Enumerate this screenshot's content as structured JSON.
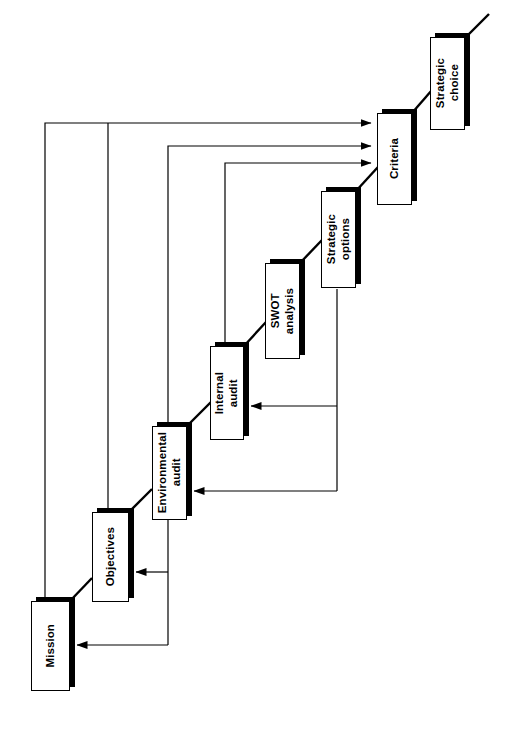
{
  "diagram": {
    "orientation": "rotated-90-ccw",
    "nodes": [
      {
        "id": "mission",
        "label": "Mission",
        "x": 31,
        "y": 601,
        "w": 39,
        "h": 90
      },
      {
        "id": "objectives",
        "label": "Objectives",
        "x": 92,
        "y": 512,
        "w": 37,
        "h": 90
      },
      {
        "id": "environmental-audit",
        "label": "Environmental\naudit",
        "x": 152,
        "y": 426,
        "w": 35,
        "h": 94
      },
      {
        "id": "internal-audit",
        "label": "Internal\naudit",
        "x": 210,
        "y": 346,
        "w": 34,
        "h": 94
      },
      {
        "id": "swot-analysis",
        "label": "SWOT\nanalysis",
        "x": 265,
        "y": 263,
        "w": 35,
        "h": 96
      },
      {
        "id": "strategic-options",
        "label": "Strategic\noptions",
        "x": 321,
        "y": 191,
        "w": 35,
        "h": 97
      },
      {
        "id": "criteria",
        "label": "Criteria",
        "x": 377,
        "y": 113,
        "w": 35,
        "h": 92
      },
      {
        "id": "strategic-choice",
        "label": "Strategic\nchoice",
        "x": 430,
        "y": 37,
        "w": 35,
        "h": 93
      }
    ],
    "colors": {
      "line": "#000000",
      "box_fill": "#ffffff",
      "box_border": "#000000",
      "shadow": "#000000",
      "background": "#ffffff"
    },
    "connections": [
      {
        "from": "mission",
        "to": "objectives",
        "type": "diagonal"
      },
      {
        "from": "objectives",
        "to": "environmental-audit",
        "type": "diagonal"
      },
      {
        "from": "environmental-audit",
        "to": "internal-audit",
        "type": "diagonal"
      },
      {
        "from": "internal-audit",
        "to": "swot-analysis",
        "type": "diagonal"
      },
      {
        "from": "swot-analysis",
        "to": "strategic-options",
        "type": "diagonal"
      },
      {
        "from": "strategic-options",
        "to": "criteria",
        "type": "diagonal"
      },
      {
        "from": "criteria",
        "to": "strategic-choice",
        "type": "diagonal"
      },
      {
        "from": "strategic-choice",
        "to": "output",
        "type": "diagonal-open"
      },
      {
        "from": "mission",
        "to": "criteria",
        "type": "feedback-orthogonal"
      },
      {
        "from": "objectives",
        "to": "criteria",
        "type": "feedback-orthogonal"
      },
      {
        "from": "environmental-audit",
        "to": "criteria",
        "type": "feedback-orthogonal"
      },
      {
        "from": "internal-audit",
        "to": "criteria",
        "type": "feedback-orthogonal"
      },
      {
        "from": "strategic-options",
        "to": "internal-audit",
        "type": "feedback-arrow"
      },
      {
        "from": "strategic-options",
        "to": "environmental-audit",
        "type": "feedback-arrow"
      },
      {
        "from": "environmental-audit",
        "to": "objectives",
        "type": "feedback-arrow"
      },
      {
        "from": "environmental-audit",
        "to": "mission",
        "type": "feedback-arrow"
      }
    ]
  }
}
